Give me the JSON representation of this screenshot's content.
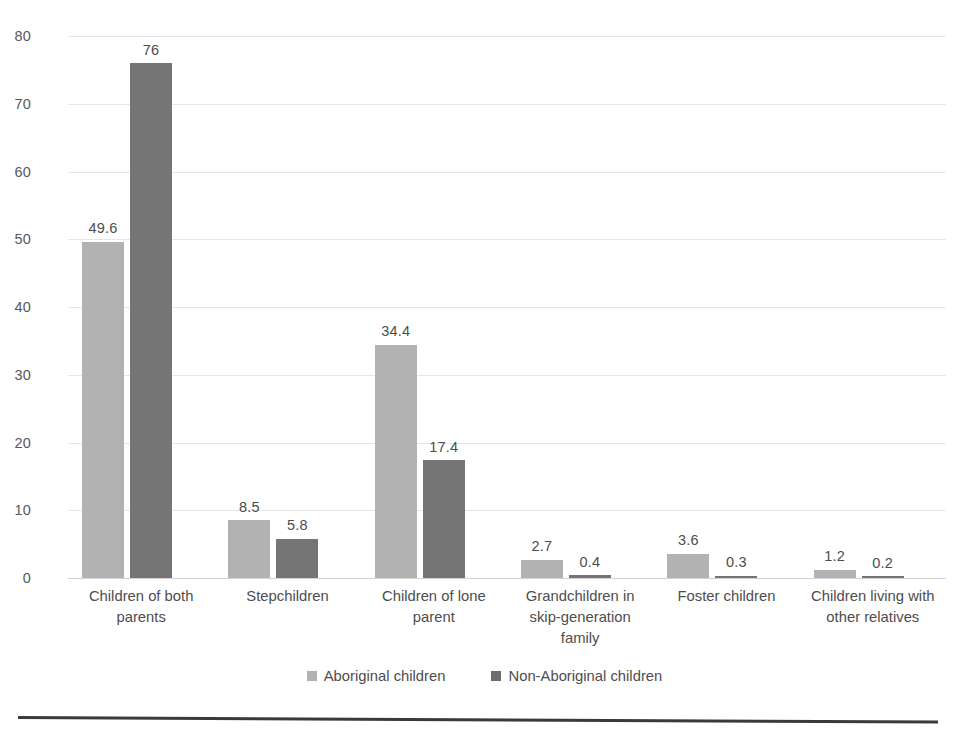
{
  "chart_data": {
    "type": "bar",
    "title": "",
    "subtitle": "",
    "xlabel": "",
    "ylabel": "",
    "ylim": [
      0,
      80
    ],
    "ytick_values": [
      0,
      10,
      20,
      30,
      40,
      50,
      60,
      70,
      80
    ],
    "ytick_labels": [
      "0",
      "10",
      "20",
      "30",
      "40",
      "50",
      "60",
      "70",
      "80"
    ],
    "grid": true,
    "legend_position": "bottom",
    "categories": [
      "Children of both parents",
      "Stepchildren",
      "Children of lone parent",
      "Grandchildren in skip-generation family",
      "Foster children",
      "Children living with other relatives"
    ],
    "series": [
      {
        "name": "Aboriginal children",
        "color": "#b2b2b2",
        "values": [
          49.6,
          8.5,
          34.4,
          2.7,
          3.6,
          1.2
        ],
        "labels": [
          "49.6",
          "8.5",
          "34.4",
          "2.7",
          "3.6",
          "1.2"
        ]
      },
      {
        "name": "Non-Aboriginal children",
        "color": "#757575",
        "values": [
          76,
          5.8,
          17.4,
          0.4,
          0.3,
          0.2
        ],
        "labels": [
          "76",
          "5.8",
          "17.4",
          "0.4",
          "0.3",
          "0.2"
        ]
      }
    ]
  },
  "axis": {
    "yticks": [
      {
        "label": "80",
        "value": 80
      },
      {
        "label": "70",
        "value": 70
      },
      {
        "label": "60",
        "value": 60
      },
      {
        "label": "50",
        "value": 50
      },
      {
        "label": "40",
        "value": 40
      },
      {
        "label": "30",
        "value": 30
      },
      {
        "label": "20",
        "value": 20
      },
      {
        "label": "10",
        "value": 10
      },
      {
        "label": "0",
        "value": 0
      }
    ]
  },
  "categories_display": [
    {
      "line1": "Children of both",
      "line2": "parents",
      "line3": ""
    },
    {
      "line1": "Stepchildren",
      "line2": "",
      "line3": ""
    },
    {
      "line1": "Children of lone",
      "line2": "parent",
      "line3": ""
    },
    {
      "line1": "Grandchildren in",
      "line2": "skip-generation",
      "line3": "family"
    },
    {
      "line1": "Foster children",
      "line2": "",
      "line3": ""
    },
    {
      "line1": "Children living with",
      "line2": "other relatives",
      "line3": ""
    }
  ],
  "legend": {
    "items": [
      {
        "label": "Aboriginal children",
        "color": "#b2b2b2",
        "swatch": "legend-swatch-square"
      },
      {
        "label": "Non-Aboriginal children",
        "color": "#6e6e6e",
        "swatch": "legend-swatch-square"
      }
    ]
  },
  "colors": {
    "series_a": "#b2b2b2",
    "series_b": "#757575",
    "gridline": "#e6e6e6",
    "baseline": "#d2d2d2",
    "text": "#4d4d4d",
    "page_rule": "#3a3a3a"
  }
}
